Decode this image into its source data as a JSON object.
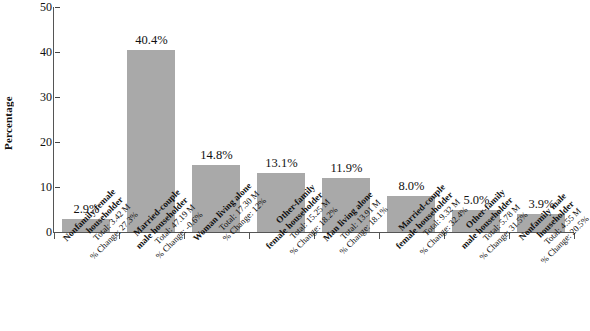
{
  "chart_data": {
    "type": "bar",
    "title": "",
    "xlabel": "",
    "ylabel": "Percentage",
    "ylim": [
      0,
      50
    ],
    "yticks": [
      0,
      10,
      20,
      30,
      40,
      50
    ],
    "grid": false,
    "legend": null,
    "bar_color": "#a9a9a9",
    "categories": [
      "Nonfamily female householder",
      "Married-couple male householder",
      "Woman living alone",
      "Other-family female householder",
      "Man living alone",
      "Married-couple female householder",
      "Other-family male householder",
      "Nonfamily male householder"
    ],
    "values": [
      2.9,
      40.4,
      14.8,
      13.1,
      11.9,
      8.0,
      5.0,
      3.9
    ],
    "data_labels": [
      "2.9%",
      "40.4%",
      "14.8%",
      "13.1%",
      "11.9%",
      "8.0%",
      "5.0%",
      "3.9%"
    ],
    "tick_labels": [
      {
        "name": "Nonfamily female householder",
        "name_line1": "Nonfamily female",
        "name_line2": "householder",
        "total": "Total: 3.42 M",
        "change": "% Change: 27.3%"
      },
      {
        "name": "Married-couple male householder",
        "name_line1": "Married-couple",
        "name_line2": "male householder",
        "total": "Total: 47.19 M",
        "change": "% Change: -0.6%"
      },
      {
        "name": "Woman living alone",
        "name_line1": "Woman living alone",
        "name_line2": "",
        "total": "Total: 17.30 M",
        "change": "% Change: 12%"
      },
      {
        "name": "Other-family female householder",
        "name_line1": "Other-family",
        "name_line2": "female householder",
        "total": "Total: 15.25 M",
        "change": "% Change: 18.2%"
      },
      {
        "name": "Man living alone",
        "name_line1": "Man living alone",
        "name_line2": "",
        "total": "Total: 13.91 M",
        "change": "% Change: 18.1%"
      },
      {
        "name": "Married-couple female householder",
        "name_line1": "Married-couple",
        "name_line2": "female householder",
        "total": "Total: 9.32 M",
        "change": "% Change: 32.4%"
      },
      {
        "name": "Other-family male householder",
        "name_line1": "Other-family",
        "name_line2": "male householder",
        "total": "Total: 5.78 M",
        "change": "% Change: 31.5%"
      },
      {
        "name": "Nonfamily male householder",
        "name_line1": "Nonfamily male",
        "name_line2": "householder",
        "total": "Total: 4.55 M",
        "change": "% Change: 20.5%"
      }
    ]
  }
}
